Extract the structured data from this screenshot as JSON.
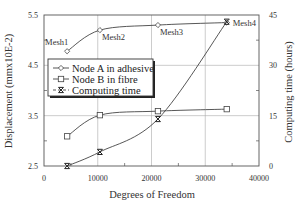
{
  "chart_data": {
    "type": "line",
    "title": "",
    "xlabel": "Degrees of Freedom",
    "ylabel": "Displacement (mmx10E-2)",
    "y2label": "Computing time (hours)",
    "xlim": [
      0,
      40000
    ],
    "ylim": [
      2.5,
      5.5
    ],
    "y2lim": [
      0,
      45
    ],
    "xticks": [
      "0",
      "10000",
      "20000",
      "30000",
      "40000"
    ],
    "yticks": [
      "2.5",
      "3.5",
      "4.5",
      "5.5"
    ],
    "y2ticks": [
      "0",
      "15",
      "30",
      "45"
    ],
    "grid": true,
    "legend_position": "upper-left (inset)",
    "x": [
      4300,
      10400,
      21200,
      34000
    ],
    "annotations": [
      "Mesh1",
      "Mesh2",
      "Mesh3",
      "Mesh4"
    ],
    "series": [
      {
        "name": "Node A in adhesive",
        "axis": "left",
        "marker": "diamond",
        "values": [
          4.78,
          5.2,
          5.3,
          5.35
        ]
      },
      {
        "name": "Node B in fibre",
        "axis": "left",
        "marker": "square",
        "values": [
          3.09,
          3.51,
          3.59,
          3.63
        ]
      },
      {
        "name": "Computing time",
        "axis": "right",
        "marker": "x",
        "values": [
          0,
          4.2,
          14,
          43
        ]
      }
    ]
  },
  "colors": {
    "axis": "#555555",
    "grid": "#aaaaaa",
    "line": "#444444",
    "text": "#333333"
  }
}
